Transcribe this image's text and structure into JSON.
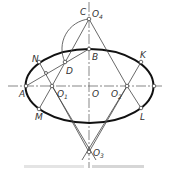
{
  "figure": {
    "labels": {
      "C": "C",
      "O4": "O",
      "O4_sub": "4",
      "B": "B",
      "N": "N",
      "D": "D",
      "K": "K",
      "A": "A",
      "O1": "O",
      "O1_sub": "1",
      "O": "O",
      "O2": "O",
      "O2_sub": "2",
      "M": "M",
      "L": "L",
      "O3": "O",
      "O3_sub": "3"
    }
  }
}
